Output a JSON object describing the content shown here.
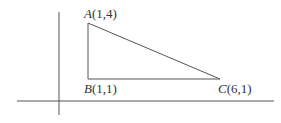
{
  "diagram": {
    "type": "coordinate-geometry-triangle",
    "colors": {
      "background": "#ffffff",
      "line": "#555555",
      "axis": "#555555",
      "text": "#333333"
    },
    "axes": {
      "x_axis": {
        "x1": 17,
        "y": 101,
        "x2": 274
      },
      "y_axis": {
        "x": 59,
        "y1": 12,
        "y2": 115
      }
    },
    "vertices": [
      {
        "id": "A",
        "name": "A",
        "coords": "(1,4)",
        "x": 1,
        "y": 4,
        "px": 88,
        "py": 23
      },
      {
        "id": "B",
        "name": "B",
        "coords": "(1,1)",
        "x": 1,
        "y": 1,
        "px": 88,
        "py": 79
      },
      {
        "id": "C",
        "name": "C",
        "coords": "(6,1)",
        "x": 6,
        "y": 1,
        "px": 220,
        "py": 79
      }
    ],
    "labels": {
      "A": {
        "name": "A",
        "coords": "(1,4)"
      },
      "B": {
        "name": "B",
        "coords": "(1,1)"
      },
      "C": {
        "name": "C",
        "coords": "(6,1)"
      }
    }
  }
}
